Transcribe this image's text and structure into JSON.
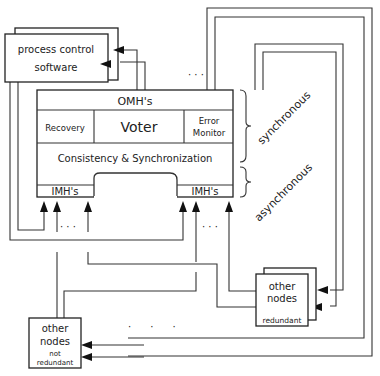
{
  "diagram": {
    "process_control": {
      "line1": "process control",
      "line2": "software"
    },
    "core": {
      "omh": "OMH's",
      "recovery": "Recovery",
      "voter": "Voter",
      "error_monitor_line1": "Error",
      "error_monitor_line2": "Monitor",
      "consistency": "Consistency & Synchronization",
      "imh_left": "IMH's",
      "imh_right": "IMH's"
    },
    "labels": {
      "synchronous": "synchronous",
      "asynchronous": "asynchronous",
      "ellipsis": "· · ·",
      "dots_spaced": "·      ·      ·"
    },
    "other_nodes_redundant": {
      "line1": "other",
      "line2": "nodes",
      "tag": "redundant"
    },
    "other_nodes_not_redundant": {
      "line1": "other",
      "line2": "nodes",
      "tag1": "not",
      "tag2": "redundant"
    },
    "colors": {
      "line": "#333333",
      "background": "#ffffff"
    }
  }
}
